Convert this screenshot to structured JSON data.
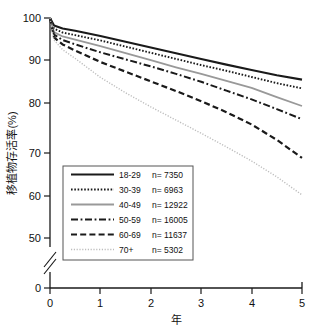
{
  "chart_data": {
    "type": "line",
    "title": "",
    "xlabel": "年",
    "ylabel": "移植物存活率(%)",
    "xlim": [
      0,
      5
    ],
    "ylim": [
      45,
      100
    ],
    "y_axis_break": true,
    "y_break_below": 45,
    "grid": false,
    "legend_position": "lower-left",
    "xticks": [
      "0",
      "1",
      "2",
      "3",
      "4",
      "5"
    ],
    "xtick_values": [
      0,
      1,
      2,
      3,
      4,
      5
    ],
    "yticks": [
      "0",
      "50",
      "60",
      "70",
      "80",
      "90",
      "100"
    ],
    "ytick_values": [
      0,
      50,
      60,
      70,
      80,
      90,
      100
    ],
    "x": [
      0,
      0.08,
      0.25,
      0.5,
      1,
      1.5,
      2,
      2.5,
      3,
      3.5,
      4,
      4.5,
      5
    ],
    "series": [
      {
        "name": "18-29",
        "n_label": "n= 7350",
        "n": 7350,
        "style": "solid",
        "color": "#1a1a1a",
        "width": 2.1,
        "values": [
          100,
          98.3,
          97.6,
          97.1,
          95.9,
          94.6,
          93.3,
          92.0,
          90.7,
          89.4,
          88.2,
          87.0,
          86.0
        ]
      },
      {
        "name": "30-39",
        "n_label": "n= 6963",
        "n": 6963,
        "style": "dotted",
        "color": "#1a1a1a",
        "width": 1.9,
        "values": [
          100,
          97.6,
          96.7,
          96.1,
          94.9,
          93.5,
          92.1,
          90.7,
          89.3,
          88.0,
          86.6,
          85.2,
          84.0
        ]
      },
      {
        "name": "40-49",
        "n_label": "n= 12922",
        "n": 12922,
        "style": "solid",
        "color": "#999999",
        "width": 1.8,
        "values": [
          100,
          96.8,
          95.8,
          95.1,
          93.6,
          92.0,
          90.4,
          88.8,
          87.3,
          85.7,
          84.1,
          82.0,
          80.0
        ]
      },
      {
        "name": "50-59",
        "n_label": "n= 16005",
        "n": 16005,
        "style": "dashdot",
        "color": "#1a1a1a",
        "width": 2.0,
        "values": [
          100,
          96.2,
          95.0,
          94.0,
          92.2,
          90.6,
          89.0,
          87.3,
          85.5,
          83.5,
          81.5,
          79.3,
          77.0
        ]
      },
      {
        "name": "60-69",
        "n_label": "n= 11637",
        "n": 11637,
        "style": "dashed",
        "color": "#1a1a1a",
        "width": 2.2,
        "values": [
          100,
          95.6,
          94.0,
          92.6,
          90.0,
          87.8,
          85.6,
          83.4,
          81.1,
          78.6,
          75.8,
          72.3,
          68.2
        ]
      },
      {
        "name": "70+",
        "n_label": "n= 5302",
        "n": 5302,
        "style": "finedot",
        "color": "#bdbdbd",
        "width": 1.4,
        "values": [
          100,
          95.0,
          92.8,
          90.8,
          86.5,
          83.0,
          79.8,
          76.8,
          73.8,
          70.7,
          67.5,
          63.9,
          59.8
        ]
      }
    ]
  },
  "legend": {
    "rows": [
      {
        "label": "18-29",
        "n": "n= 7350"
      },
      {
        "label": "30-39",
        "n": "n= 6963"
      },
      {
        "label": "40-49",
        "n": "n= 12922"
      },
      {
        "label": "50-59",
        "n": "n= 16005"
      },
      {
        "label": "60-69",
        "n": "n= 11637"
      },
      {
        "label": "70+",
        "n": "n= 5302"
      }
    ]
  },
  "axes": {
    "y_title": "移植物存活率(%)",
    "x_title": "年",
    "ytick_labels": [
      "100",
      "90",
      "80",
      "70",
      "60",
      "50",
      "0"
    ],
    "xtick_labels": [
      "0",
      "1",
      "2",
      "3",
      "4",
      "5"
    ]
  },
  "colors": {
    "axis": "#1a1a1a",
    "dark_line": "#1a1a1a",
    "gray_line": "#999999",
    "light_line": "#bdbdbd",
    "background": "#ffffff"
  }
}
